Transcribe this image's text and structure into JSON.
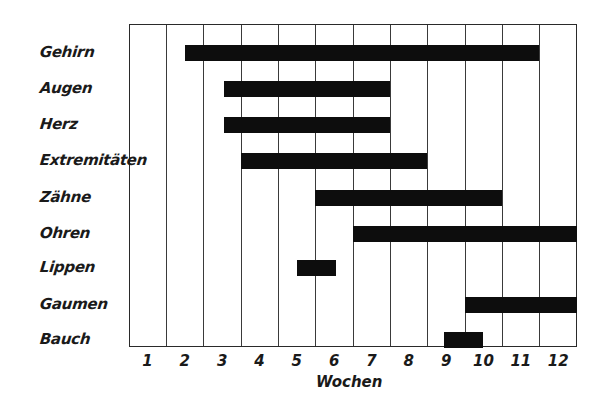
{
  "chart_data": {
    "type": "gantt",
    "title": "",
    "xlabel": "Wochen",
    "ylabel": "",
    "xlim": [
      0,
      12
    ],
    "x_ticks": [
      "1",
      "2",
      "3",
      "4",
      "5",
      "6",
      "7",
      "8",
      "9",
      "10",
      "11",
      "12"
    ],
    "grid": {
      "vertical": true,
      "horizontal": false
    },
    "legend": null,
    "categories": [
      "Gehirn",
      "Augen",
      "Herz",
      "Extremitäten",
      "Zähne",
      "Ohren",
      "Lippen",
      "Gaumen",
      "Bauch"
    ],
    "bars": [
      {
        "label": "Gehirn",
        "start": 1.5,
        "end": 11.0
      },
      {
        "label": "Augen",
        "start": 2.55,
        "end": 7.0
      },
      {
        "label": "Herz",
        "start": 2.55,
        "end": 7.0
      },
      {
        "label": "Extremitäten",
        "start": 3.0,
        "end": 8.0
      },
      {
        "label": "Zähne",
        "start": 5.0,
        "end": 10.0
      },
      {
        "label": "Ohren",
        "start": 6.0,
        "end": 12.0
      },
      {
        "label": "Lippen",
        "start": 4.5,
        "end": 5.55
      },
      {
        "label": "Gaumen",
        "start": 9.0,
        "end": 12.0
      },
      {
        "label": "Bauch",
        "start": 8.45,
        "end": 9.5
      }
    ],
    "colors": {
      "bar": "#0d0d0d",
      "grid": "#3a3a3a",
      "background": "#ffffff"
    }
  }
}
